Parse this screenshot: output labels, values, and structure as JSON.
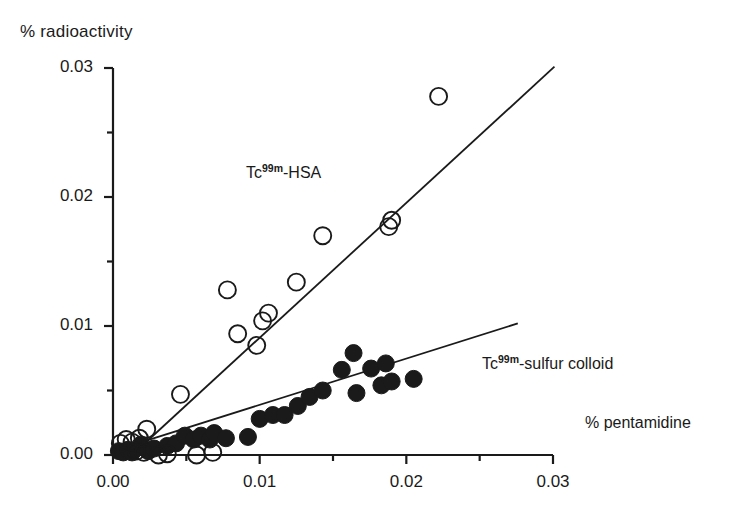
{
  "chart_data": {
    "type": "scatter",
    "title": "",
    "xlabel": "% pentamidine",
    "ylabel": "% radioactivity",
    "xlim": [
      0.0,
      0.03
    ],
    "ylim": [
      0.0,
      0.03
    ],
    "xticks": [
      "0.00",
      "0.01",
      "0.02",
      "0.03"
    ],
    "xtick_values": [
      0.0,
      0.01,
      0.02,
      0.03
    ],
    "yticks": [
      "0.00",
      "0.01",
      "0.02",
      "0.03"
    ],
    "ytick_values": [
      0.0,
      0.01,
      0.02,
      0.03
    ],
    "minor_tick_interval": 0.005,
    "grid": false,
    "legend_position": "inline-annotation",
    "series": [
      {
        "name": "Tc99m-HSA",
        "label_prefix": "Tc",
        "label_superscript": "99m",
        "label_suffix": "-HSA",
        "marker": "open-circle",
        "color": "#1a1a1a",
        "fill": "none",
        "points": [
          [
            0.0005,
            0.0009
          ],
          [
            0.0009,
            0.0012
          ],
          [
            0.0013,
            0.001
          ],
          [
            0.0016,
            0.0003
          ],
          [
            0.0018,
            0.0013
          ],
          [
            0.0021,
            0.0002
          ],
          [
            0.0023,
            0.002
          ],
          [
            0.0031,
            0.0
          ],
          [
            0.0037,
            0.0001
          ],
          [
            0.0046,
            0.0047
          ],
          [
            0.0057,
            0.0
          ],
          [
            0.0068,
            0.0002
          ],
          [
            0.0078,
            0.0128
          ],
          [
            0.0085,
            0.0094
          ],
          [
            0.0098,
            0.0085
          ],
          [
            0.0102,
            0.0104
          ],
          [
            0.0106,
            0.011
          ],
          [
            0.0125,
            0.0134
          ],
          [
            0.0143,
            0.017
          ],
          [
            0.0188,
            0.0177
          ],
          [
            0.019,
            0.0182
          ],
          [
            0.0222,
            0.0278
          ]
        ],
        "trendline": {
          "x0": 0.0013,
          "y0": 0.0,
          "x1": 0.0301,
          "y1": 0.0301
        }
      },
      {
        "name": "Tc99m-sulfur colloid",
        "label_prefix": "Tc",
        "label_superscript": "99m",
        "label_suffix": "-sulfur colloid",
        "marker": "filled-circle",
        "color": "#1a1a1a",
        "fill": "#1a1a1a",
        "points": [
          [
            0.0004,
            0.0003
          ],
          [
            0.0007,
            0.0002
          ],
          [
            0.001,
            0.0004
          ],
          [
            0.0013,
            0.0002
          ],
          [
            0.0019,
            0.0008
          ],
          [
            0.0024,
            0.0003
          ],
          [
            0.0028,
            0.0005
          ],
          [
            0.0037,
            0.0007
          ],
          [
            0.0043,
            0.0009
          ],
          [
            0.0049,
            0.0015
          ],
          [
            0.0055,
            0.0012
          ],
          [
            0.006,
            0.0015
          ],
          [
            0.0066,
            0.0012
          ],
          [
            0.0069,
            0.0017
          ],
          [
            0.0077,
            0.0013
          ],
          [
            0.0092,
            0.0014
          ],
          [
            0.01,
            0.0028
          ],
          [
            0.0109,
            0.0031
          ],
          [
            0.0117,
            0.0031
          ],
          [
            0.0126,
            0.0038
          ],
          [
            0.0134,
            0.0045
          ],
          [
            0.0143,
            0.005
          ],
          [
            0.0156,
            0.0066
          ],
          [
            0.0164,
            0.0079
          ],
          [
            0.0166,
            0.0048
          ],
          [
            0.0176,
            0.0067
          ],
          [
            0.0183,
            0.0054
          ],
          [
            0.0186,
            0.0071
          ],
          [
            0.019,
            0.0057
          ],
          [
            0.0205,
            0.0059
          ]
        ],
        "trendline": {
          "x0": 0.0,
          "y0": 0.0003,
          "x1": 0.0276,
          "y1": 0.0102
        }
      }
    ]
  },
  "axes": {
    "y_axis_title": "% radioactivity",
    "x_axis_title": "% pentamidine"
  },
  "annotations": {
    "hsa": {
      "prefix": "Tc",
      "sup": "99m",
      "suffix": "-HSA"
    },
    "sulfur": {
      "prefix": "Tc",
      "sup": "99m",
      "suffix": "-sulfur colloid"
    }
  }
}
